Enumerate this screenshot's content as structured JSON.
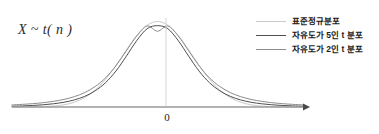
{
  "figure": {
    "dist_label": "X ~ t( n )",
    "origin_label": "0",
    "background": "#ffffff"
  },
  "legend": {
    "position": "top-right",
    "items": [
      {
        "label": "표준정규분포",
        "color": "#c9c9c9",
        "width": 1.6
      },
      {
        "label": "자유도가 5인 t 분포",
        "color": "#4f4f4f",
        "width": 1.9
      },
      {
        "label": "자유도가 2인 t 분포",
        "color": "#8c8c8c",
        "width": 1.9
      }
    ]
  },
  "axis": {
    "color": "#9a9a9a",
    "y": 107,
    "x_start": 12,
    "x_end": 303,
    "arrow": true,
    "centerline_color": "#cfcfcf",
    "center_x": 166
  },
  "chart_data": {
    "type": "line",
    "title": "",
    "xlabel": "",
    "ylabel": "",
    "xlim": [
      -4.2,
      4.2
    ],
    "ylim": [
      0,
      0.42
    ],
    "grid": false,
    "legend_position": "top-right",
    "annotations": [
      {
        "text": "X ~ t( n )",
        "x": -3.6,
        "y": 0.34
      },
      {
        "text": "0",
        "x": 0,
        "y": -0.03
      }
    ],
    "x": [
      -4.2,
      -3.9,
      -3.6,
      -3.3,
      -3.0,
      -2.7,
      -2.4,
      -2.1,
      -1.8,
      -1.5,
      -1.2,
      -0.9,
      -0.6,
      -0.3,
      0.0,
      0.3,
      0.6,
      0.9,
      1.2,
      1.5,
      1.8,
      2.1,
      2.4,
      2.7,
      3.0,
      3.3,
      3.6,
      3.9,
      4.2
    ],
    "series": [
      {
        "name": "표준정규분포",
        "color": "#c9c9c9",
        "values": [
          0.0001,
          0.0002,
          0.0006,
          0.0017,
          0.0044,
          0.0104,
          0.0224,
          0.044,
          0.079,
          0.1295,
          0.1942,
          0.2661,
          0.3332,
          0.3814,
          0.3989,
          0.3814,
          0.3332,
          0.2661,
          0.1942,
          0.1295,
          0.079,
          0.044,
          0.0224,
          0.0104,
          0.0044,
          0.0017,
          0.0006,
          0.0002,
          0.0001
        ]
      },
      {
        "name": "자유도가 5인 t 분포",
        "color": "#4f4f4f",
        "values": [
          0.0037,
          0.0051,
          0.0072,
          0.0104,
          0.0151,
          0.0222,
          0.0331,
          0.0498,
          0.0755,
          0.1136,
          0.1676,
          0.2371,
          0.3096,
          0.3652,
          0.3796,
          0.3652,
          0.3096,
          0.2371,
          0.1676,
          0.1136,
          0.0755,
          0.0498,
          0.0331,
          0.0222,
          0.0151,
          0.0104,
          0.0072,
          0.0051,
          0.0037
        ]
      },
      {
        "name": "자유도가 2인 t 분포",
        "color": "#8c8c8c",
        "values": [
          0.0098,
          0.0123,
          0.0156,
          0.0201,
          0.0265,
          0.0354,
          0.0484,
          0.0674,
          0.0955,
          0.1361,
          0.1924,
          0.2619,
          0.3313,
          0.378,
          0.3536,
          0.378,
          0.3313,
          0.2619,
          0.1924,
          0.1361,
          0.0955,
          0.0674,
          0.0484,
          0.0354,
          0.0265,
          0.0201,
          0.0156,
          0.0123,
          0.0098
        ]
      }
    ]
  }
}
